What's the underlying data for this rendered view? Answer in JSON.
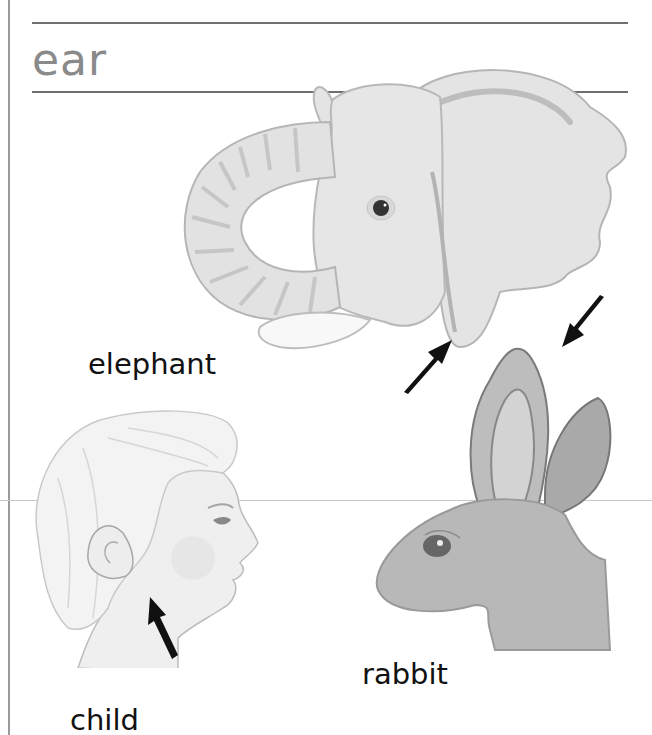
{
  "page": {
    "heading": "ear",
    "colors": {
      "heading": "#8a8a8a",
      "rule": "#707070",
      "label": "#111111",
      "arrow": "#111111"
    }
  },
  "illustrations": [
    {
      "id": "elephant",
      "label": "elephant",
      "arrows": 1
    },
    {
      "id": "rabbit",
      "label": "rabbit",
      "arrows": 1
    },
    {
      "id": "child",
      "label": "child",
      "arrows": 1
    }
  ],
  "icons": {
    "arrow": "arrow-pointing-to-ear"
  }
}
